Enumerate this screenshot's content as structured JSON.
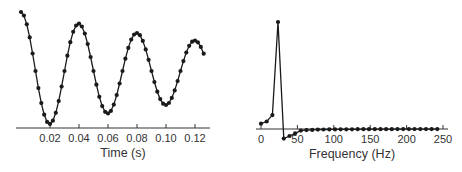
{
  "chart_data": [
    {
      "type": "line",
      "title": "",
      "xlabel": "Time (s)",
      "ylabel": "",
      "xlim": [
        0,
        0.128
      ],
      "xticks": [
        0.02,
        0.04,
        0.06,
        0.08,
        0.1,
        0.12
      ],
      "xtick_labels": [
        "0.02",
        "0.04",
        "0.06",
        "0.08",
        "0.10",
        "0.12"
      ],
      "grid": false,
      "markers": true,
      "sample_interval": 0.002,
      "x": [
        0.0,
        0.002,
        0.004,
        0.006,
        0.008,
        0.01,
        0.012,
        0.014,
        0.016,
        0.018,
        0.02,
        0.022,
        0.024,
        0.026,
        0.028,
        0.03,
        0.032,
        0.034,
        0.036,
        0.038,
        0.04,
        0.042,
        0.044,
        0.046,
        0.048,
        0.05,
        0.052,
        0.054,
        0.056,
        0.058,
        0.06,
        0.062,
        0.064,
        0.066,
        0.068,
        0.07,
        0.072,
        0.074,
        0.076,
        0.078,
        0.08,
        0.082,
        0.084,
        0.086,
        0.088,
        0.09,
        0.092,
        0.094,
        0.096,
        0.098,
        0.1,
        0.102,
        0.104,
        0.106,
        0.108,
        0.11,
        0.112,
        0.114,
        0.116,
        0.118,
        0.12,
        0.122,
        0.124,
        0.126
      ],
      "values": [
        1.0,
        0.941,
        0.791,
        0.569,
        0.296,
        0.0,
        -0.289,
        -0.544,
        -0.741,
        -0.862,
        -0.896,
        -0.843,
        -0.709,
        -0.51,
        -0.265,
        0.0,
        0.259,
        0.488,
        0.664,
        0.772,
        0.803,
        0.755,
        0.635,
        0.457,
        0.237,
        0.0,
        -0.232,
        -0.437,
        -0.595,
        -0.691,
        -0.719,
        -0.676,
        -0.569,
        -0.409,
        -0.212,
        0.0,
        0.208,
        0.391,
        0.532,
        0.619,
        0.644,
        0.606,
        0.51,
        0.366,
        0.19,
        0.0,
        -0.186,
        -0.35,
        -0.477,
        -0.554,
        -0.577,
        -0.543,
        -0.456,
        -0.328,
        -0.171,
        0.0,
        0.167,
        0.314,
        0.427,
        0.497,
        0.517,
        0.486,
        0.409,
        0.294
      ]
    },
    {
      "type": "line",
      "title": "",
      "xlabel": "Frequency (Hz)",
      "ylabel": "",
      "xlim": [
        0,
        250
      ],
      "xticks": [
        0,
        50,
        100,
        150,
        200,
        250
      ],
      "xtick_labels": [
        "0",
        "50",
        "100",
        "150",
        "200",
        "250"
      ],
      "grid": false,
      "markers": true,
      "x": [
        0,
        7.8,
        15.6,
        23.4,
        31.3,
        39.1,
        46.9,
        54.7,
        62.5,
        70.3,
        78.1,
        85.9,
        93.8,
        101.6,
        109.4,
        117.2,
        125,
        132.8,
        140.6,
        148.4,
        156.3,
        164.1,
        171.9,
        179.7,
        187.5,
        195.3,
        203.1,
        210.9,
        218.8,
        226.6,
        234.4,
        242.2
      ],
      "values": [
        0.05,
        0.07,
        0.13,
        1.0,
        -0.09,
        -0.065,
        -0.04,
        -0.015,
        -0.01,
        -0.008,
        -0.006,
        -0.005,
        -0.004,
        -0.004,
        -0.003,
        -0.003,
        -0.003,
        -0.002,
        -0.002,
        -0.002,
        -0.002,
        -0.002,
        -0.002,
        -0.002,
        -0.001,
        -0.001,
        -0.001,
        -0.001,
        -0.001,
        -0.001,
        -0.001,
        -0.001
      ]
    }
  ],
  "style": {
    "line_color": "#1a1a1a",
    "marker_color": "#1a1a1a",
    "axis_color": "#333333",
    "text_color": "#333333"
  }
}
